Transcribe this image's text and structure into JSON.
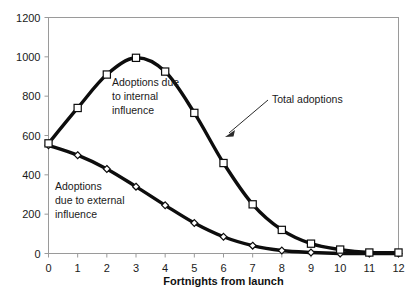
{
  "chart_data": {
    "type": "line",
    "title": "",
    "xlabel": "Fortnights from launch",
    "ylabel": "",
    "x": [
      0,
      1,
      2,
      3,
      4,
      5,
      6,
      7,
      8,
      9,
      10,
      11,
      12
    ],
    "xlim": [
      0,
      12
    ],
    "ylim": [
      0,
      1200
    ],
    "xticks": [
      "0",
      "1",
      "2",
      "3",
      "4",
      "5",
      "6",
      "7",
      "8",
      "9",
      "10",
      "11",
      "12"
    ],
    "yticks": [
      "0",
      "200",
      "400",
      "600",
      "800",
      "1000",
      "1200"
    ],
    "ytick_values": [
      0,
      200,
      400,
      600,
      800,
      1000,
      1200
    ],
    "grid": false,
    "legend": "none",
    "series": [
      {
        "name": "Total adoptions",
        "marker": "square",
        "values": [
          560,
          740,
          910,
          995,
          925,
          715,
          460,
          250,
          120,
          50,
          20,
          5,
          5
        ]
      },
      {
        "name": "Adoptions due to external influence",
        "marker": "diamond",
        "values": [
          550,
          500,
          430,
          340,
          245,
          155,
          85,
          40,
          15,
          5,
          0,
          0,
          0
        ]
      }
    ],
    "annotations": [
      {
        "id": "internal",
        "text_lines": [
          "Adoptions due",
          "to internal",
          "influence"
        ],
        "x": 112,
        "y": 86
      },
      {
        "id": "external",
        "text_lines": [
          "Adoptions",
          "due to external",
          "influence"
        ],
        "x": 55,
        "y": 190
      },
      {
        "id": "total",
        "text_lines": [
          "Total adoptions"
        ],
        "x": 272,
        "y": 103
      }
    ],
    "colors": {
      "curve": "#0d0d0d",
      "marker_fill": "#ffffff",
      "frame": "#9a9a9a",
      "text": "#1a1a1a",
      "background": "#ffffff"
    }
  }
}
